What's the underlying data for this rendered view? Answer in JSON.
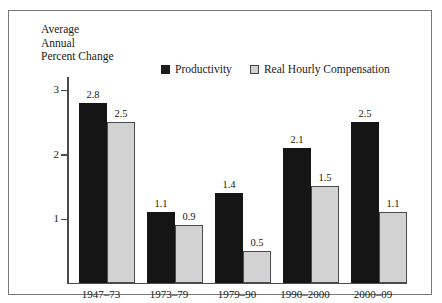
{
  "figure": {
    "caption_sliver": "",
    "frame_color": "#77787a"
  },
  "axis_title": {
    "line1": "Average",
    "line2": "Annual",
    "line3": "Percent Change"
  },
  "legend": {
    "position": "top-center",
    "entries": [
      {
        "label": "Productivity",
        "swatch": "legend-swatch-solid-black",
        "color": "#151515"
      },
      {
        "label": "Real Hourly Compensation",
        "swatch": "legend-swatch-light-gray",
        "color": "#d2d2d2"
      }
    ]
  },
  "y_axis": {
    "ticks": [
      {
        "label": "1",
        "value": 1
      },
      {
        "label": "2",
        "value": 2
      },
      {
        "label": "3",
        "value": 3
      }
    ],
    "min": 0,
    "max": 3.2
  },
  "chart_data": {
    "type": "bar",
    "title": "",
    "subtitle": "",
    "xlabel": "",
    "ylabel": "Average Annual Percent Change",
    "ylim": [
      0,
      3.2
    ],
    "yticks": [
      1,
      2,
      3
    ],
    "grid": false,
    "legend_position": "top-center",
    "categories": [
      "1947–73",
      "1973–79",
      "1979–90",
      "1990–2000",
      "2000–09"
    ],
    "series": [
      {
        "name": "Productivity",
        "color": "#151515",
        "values": [
          2.8,
          1.1,
          1.4,
          2.1,
          2.5
        ],
        "labels": [
          "2.8",
          "1.1",
          "1.4",
          "2.1",
          "2.5"
        ]
      },
      {
        "name": "Real Hourly Compensation",
        "color": "#d2d2d2",
        "values": [
          2.5,
          0.9,
          0.5,
          1.5,
          1.1
        ],
        "labels": [
          "2.5",
          "0.9",
          "0.5",
          "1.5",
          "1.1"
        ]
      }
    ]
  }
}
